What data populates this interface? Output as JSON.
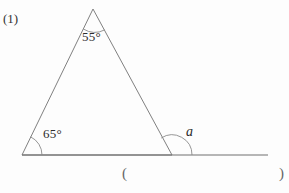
{
  "page": {
    "width": 289,
    "height": 193,
    "background": "#fdfdfd",
    "stroke_color": "#707070"
  },
  "problem": {
    "number_label": "(1)"
  },
  "figure": {
    "type": "geometry-diagram",
    "stroke_color": "#707070",
    "vertices": {
      "apex": {
        "x": 93,
        "y": 9
      },
      "bottom_left": {
        "x": 22,
        "y": 155
      },
      "bottom_right": {
        "x": 172,
        "y": 155
      }
    },
    "base_line": {
      "x1": 22,
      "y1": 155,
      "x2": 268,
      "y2": 155
    },
    "angles": [
      {
        "name": "apex-angle",
        "label": "55°",
        "value": 55,
        "vertex": "apex",
        "arc_radius": 22
      },
      {
        "name": "bottom-left-angle",
        "label": "65°",
        "value": 65,
        "vertex": "bottom_left",
        "arc_radius": 20
      },
      {
        "name": "exterior-angle",
        "label": "a",
        "value": null,
        "vertex": "bottom_right",
        "arc_radius": 20
      }
    ]
  },
  "answer": {
    "paren_open": "(",
    "paren_close": ")"
  }
}
